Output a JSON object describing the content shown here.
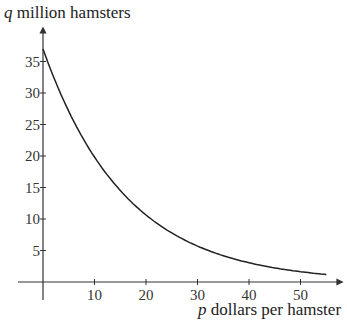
{
  "chart_data": {
    "type": "line",
    "title": "",
    "xlabel": "p dollars per hamster",
    "ylabel": "q million hamsters",
    "xlabel_var": "p",
    "xlabel_text": "dollars per hamster",
    "ylabel_var": "q",
    "ylabel_text": "million hamsters",
    "xlim": [
      0,
      57
    ],
    "ylim": [
      0,
      40
    ],
    "x_ticks": [
      10,
      20,
      30,
      40,
      50
    ],
    "y_ticks": [
      5,
      10,
      15,
      20,
      25,
      30,
      35
    ],
    "grid": false,
    "legend": null,
    "series": [
      {
        "name": "demand curve",
        "x": [
          0,
          5,
          10,
          15,
          20,
          25,
          30,
          35,
          40,
          45,
          50,
          55
        ],
        "values": [
          37,
          27.2,
          19.9,
          14.6,
          10.7,
          7.9,
          5.8,
          4.2,
          3.1,
          2.3,
          1.7,
          1.2
        ]
      }
    ]
  },
  "colors": {
    "axis": "#333333",
    "curve": "#222222"
  }
}
